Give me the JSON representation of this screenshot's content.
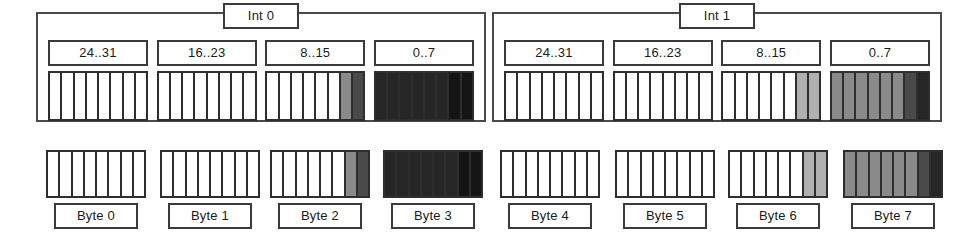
{
  "diagram": {
    "bits_per_group": 8,
    "palette": {
      "white": "#ffffff",
      "light_gray": "#b0b0b0",
      "mid_gray": "#8a8a8a",
      "dark_gray": "#4a4a4a",
      "near_black": "#262626",
      "black": "#141414",
      "outline": "#2e2e2e"
    },
    "ints": [
      {
        "label": "Int 0",
        "groups": [
          {
            "label": "24..31",
            "cells": [
              "white",
              "white",
              "white",
              "white",
              "white",
              "white",
              "white",
              "white"
            ]
          },
          {
            "label": "16..23",
            "cells": [
              "white",
              "white",
              "white",
              "white",
              "white",
              "white",
              "white",
              "white"
            ]
          },
          {
            "label": "8..15",
            "cells": [
              "white",
              "white",
              "white",
              "white",
              "white",
              "white",
              "mid_gray",
              "dark_gray"
            ]
          },
          {
            "label": "0..7",
            "cells": [
              "near_black",
              "near_black",
              "near_black",
              "near_black",
              "near_black",
              "near_black",
              "black",
              "black"
            ]
          }
        ]
      },
      {
        "label": "Int 1",
        "groups": [
          {
            "label": "24..31",
            "cells": [
              "white",
              "white",
              "white",
              "white",
              "white",
              "white",
              "white",
              "white"
            ]
          },
          {
            "label": "16..23",
            "cells": [
              "white",
              "white",
              "white",
              "white",
              "white",
              "white",
              "white",
              "white"
            ]
          },
          {
            "label": "8..15",
            "cells": [
              "white",
              "white",
              "white",
              "white",
              "white",
              "white",
              "light_gray",
              "light_gray"
            ]
          },
          {
            "label": "0..7",
            "cells": [
              "mid_gray",
              "mid_gray",
              "mid_gray",
              "mid_gray",
              "mid_gray",
              "mid_gray",
              "dark_gray",
              "near_black"
            ]
          }
        ]
      }
    ],
    "bytes": [
      {
        "label": "Byte 0",
        "cells": [
          "white",
          "white",
          "white",
          "white",
          "white",
          "white",
          "white",
          "white"
        ]
      },
      {
        "label": "Byte 1",
        "cells": [
          "white",
          "white",
          "white",
          "white",
          "white",
          "white",
          "white",
          "white"
        ]
      },
      {
        "label": "Byte 2",
        "cells": [
          "white",
          "white",
          "white",
          "white",
          "white",
          "white",
          "mid_gray",
          "dark_gray"
        ]
      },
      {
        "label": "Byte 3",
        "cells": [
          "near_black",
          "near_black",
          "near_black",
          "near_black",
          "near_black",
          "near_black",
          "black",
          "black"
        ]
      },
      {
        "label": "Byte 4",
        "cells": [
          "white",
          "white",
          "white",
          "white",
          "white",
          "white",
          "white",
          "white"
        ]
      },
      {
        "label": "Byte 5",
        "cells": [
          "white",
          "white",
          "white",
          "white",
          "white",
          "white",
          "white",
          "white"
        ]
      },
      {
        "label": "Byte 6",
        "cells": [
          "white",
          "white",
          "white",
          "white",
          "white",
          "white",
          "light_gray",
          "light_gray"
        ]
      },
      {
        "label": "Byte 7",
        "cells": [
          "mid_gray",
          "mid_gray",
          "mid_gray",
          "mid_gray",
          "mid_gray",
          "mid_gray",
          "dark_gray",
          "near_black"
        ]
      }
    ]
  }
}
